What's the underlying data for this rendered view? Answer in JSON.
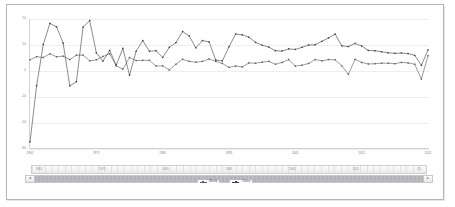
{
  "chart_data": {
    "type": "line",
    "title": "",
    "xlabel": "",
    "ylabel": "",
    "ylim": [
      -30,
      20
    ],
    "yticks": [
      20,
      10,
      0,
      -10,
      -20,
      -30
    ],
    "ytick_labels": [
      "20",
      "10",
      "0",
      "-10",
      "-20",
      "-30"
    ],
    "grid": true,
    "legend_position": "bottom",
    "x": [
      1961,
      1962,
      1963,
      1964,
      1965,
      1966,
      1967,
      1968,
      1969,
      1970,
      1971,
      1972,
      1973,
      1974,
      1975,
      1976,
      1977,
      1978,
      1979,
      1980,
      1981,
      1982,
      1983,
      1984,
      1985,
      1986,
      1987,
      1988,
      1989,
      1990,
      1991,
      1992,
      1993,
      1994,
      1995,
      1996,
      1997,
      1998,
      1999,
      2000,
      2001,
      2002,
      2003,
      2004,
      2005,
      2006,
      2007,
      2008,
      2009,
      2010,
      2011,
      2012,
      2013,
      2014,
      2015,
      2016,
      2017,
      2018,
      2019,
      2020,
      2021
    ],
    "xtick_labels": [
      "1961",
      "1971",
      "1981",
      "1991",
      "2001",
      "2011",
      "2021"
    ],
    "xticks": [
      1961,
      1971,
      1981,
      1991,
      2001,
      2011,
      2021
    ],
    "series": [
      {
        "name": "World",
        "values": [
          4.3,
          5.5,
          5.2,
          6.6,
          5.5,
          5.7,
          4.4,
          6.1,
          6.1,
          3.9,
          4.3,
          5.6,
          6.6,
          2.0,
          0.7,
          5.2,
          4.0,
          4.1,
          4.1,
          1.9,
          2.0,
          0.4,
          2.6,
          4.5,
          3.7,
          3.4,
          3.7,
          4.6,
          3.7,
          2.9,
          1.4,
          1.9,
          1.6,
          3.1,
          3.0,
          3.4,
          3.7,
          2.6,
          3.3,
          4.4,
          1.9,
          2.2,
          2.9,
          4.4,
          3.9,
          4.4,
          4.3,
          2.0,
          -1.3,
          4.5,
          3.3,
          2.7,
          2.8,
          3.0,
          3.0,
          2.8,
          3.3,
          3.1,
          2.6,
          -3.1,
          5.9
        ]
      },
      {
        "name": "China",
        "values": [
          -27.3,
          -5.6,
          10.2,
          18.3,
          17.0,
          10.7,
          -5.7,
          -4.1,
          16.9,
          19.4,
          7.0,
          3.8,
          7.9,
          2.3,
          8.7,
          -1.6,
          7.6,
          11.7,
          7.6,
          7.8,
          5.2,
          9.1,
          10.9,
          15.2,
          13.5,
          8.9,
          11.7,
          11.2,
          4.2,
          3.9,
          9.3,
          14.2,
          13.9,
          13.0,
          11.0,
          9.9,
          9.2,
          7.8,
          7.7,
          8.5,
          8.3,
          9.1,
          10.0,
          10.1,
          11.4,
          12.7,
          14.2,
          9.7,
          9.4,
          10.6,
          9.6,
          7.9,
          7.8,
          7.4,
          7.0,
          6.8,
          6.9,
          6.7,
          6.0,
          2.2,
          8.1
        ]
      }
    ],
    "series_colors": [
      "#595959",
      "#3d3d3d"
    ]
  },
  "legend": {
    "items": [
      {
        "label": "World",
        "color": "#595959"
      },
      {
        "label": "China",
        "color": "#3d3d3d"
      }
    ]
  },
  "range_slider": {
    "labels": [
      "1961",
      "1971",
      "1981",
      "1991",
      "2001",
      "2011",
      "21"
    ],
    "left_arrow": "◂",
    "right_arrow": "▸"
  }
}
